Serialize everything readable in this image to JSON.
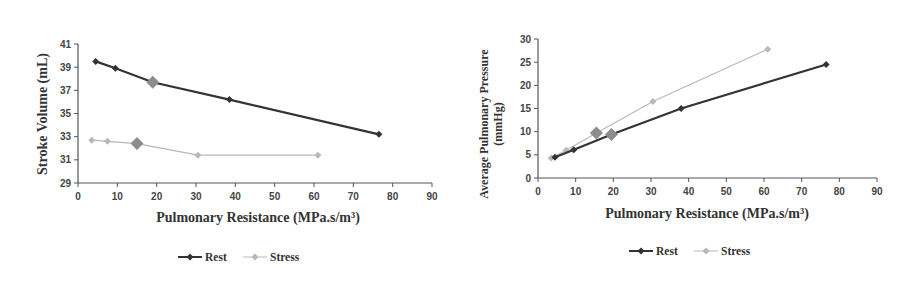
{
  "chart_data": [
    {
      "type": "line",
      "title": "",
      "xlabel": "Pulmonary Resistance (MPa.s/m³)",
      "ylabel": "Stroke Volume (mL)",
      "xlim": [
        0,
        90
      ],
      "ylim": [
        29,
        41
      ],
      "xticks": [
        0,
        10,
        20,
        30,
        40,
        50,
        60,
        70,
        80,
        90
      ],
      "yticks": [
        29,
        31,
        33,
        35,
        37,
        39,
        41
      ],
      "grid": false,
      "legend_position": "bottom",
      "series": [
        {
          "name": "Rest",
          "color": "#333333",
          "x": [
            4.5,
            9.5,
            19,
            38.5,
            76.5
          ],
          "y": [
            39.5,
            38.9,
            37.7,
            36.2,
            33.2
          ],
          "highlight_index": 2
        },
        {
          "name": "Stress",
          "color": "#b8b8b8",
          "x": [
            3.5,
            7.5,
            15,
            30.5,
            61
          ],
          "y": [
            32.7,
            32.6,
            32.4,
            31.4,
            31.4
          ],
          "highlight_index": 2
        }
      ]
    },
    {
      "type": "line",
      "title": "",
      "xlabel": "Pulmonary Resistance (MPa.s/m³)",
      "ylabel": "Average Pulmonary Pressure (mmHg)",
      "ylabel_lines": [
        "Average Pulmonary Pressure",
        "(mmHg)"
      ],
      "xlim": [
        0,
        90
      ],
      "ylim": [
        0,
        30
      ],
      "xticks": [
        0,
        10,
        20,
        30,
        40,
        50,
        60,
        70,
        80,
        90
      ],
      "yticks": [
        0,
        5,
        10,
        15,
        20,
        25,
        30
      ],
      "grid": false,
      "legend_position": "bottom",
      "series": [
        {
          "name": "Rest",
          "color": "#333333",
          "x": [
            4.5,
            9.5,
            19.5,
            38,
            76.5
          ],
          "y": [
            4.5,
            6.1,
            9.4,
            15.0,
            24.5
          ],
          "highlight_index": 2
        },
        {
          "name": "Stress",
          "color": "#b8b8b8",
          "x": [
            3.5,
            7.5,
            15.5,
            30.5,
            61
          ],
          "y": [
            4.3,
            6.0,
            9.7,
            16.5,
            27.8
          ],
          "highlight_index": 2
        }
      ]
    }
  ],
  "colors": {
    "rest": "#333333",
    "stress": "#b8b8b8",
    "highlight_marker": "#8c8c8c",
    "axis": "#555555"
  },
  "legend": {
    "rest_label": "Rest",
    "stress_label": "Stress"
  }
}
